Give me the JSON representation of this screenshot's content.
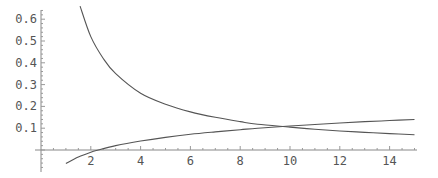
{
  "chart_data": {
    "type": "line",
    "title": "",
    "xlabel": "",
    "ylabel": "",
    "xlim": [
      0,
      15.1
    ],
    "ylim": [
      -0.09,
      0.66
    ],
    "grid": false,
    "legend": null,
    "x_ticks": [
      2,
      4,
      6,
      8,
      10,
      12,
      14
    ],
    "x_tick_labels": [
      "2",
      "4",
      "6",
      "8",
      "10",
      "12",
      "14"
    ],
    "y_ticks": [
      0.1,
      0.2,
      0.3,
      0.4,
      0.5,
      0.6
    ],
    "y_tick_labels": [
      "0.1",
      "0.2",
      "0.3",
      "0.4",
      "0.5",
      "0.6"
    ],
    "series": [
      {
        "name": "decreasing",
        "x": [
          1.57,
          2,
          2.5,
          3,
          4,
          5,
          6,
          7,
          8,
          8.7,
          10,
          11,
          12,
          13,
          14,
          15
        ],
        "values": [
          0.66,
          0.52,
          0.42,
          0.35,
          0.26,
          0.21,
          0.175,
          0.15,
          0.13,
          0.118,
          0.105,
          0.095,
          0.087,
          0.081,
          0.075,
          0.07
        ]
      },
      {
        "name": "increasing",
        "x": [
          1,
          1.5,
          2,
          2.3,
          3,
          4,
          5,
          6,
          7,
          8,
          8.7,
          10,
          11,
          12,
          13,
          14,
          15
        ],
        "values": [
          -0.062,
          -0.032,
          -0.01,
          0.0,
          0.02,
          0.041,
          0.058,
          0.072,
          0.083,
          0.093,
          0.1,
          0.11,
          0.117,
          0.124,
          0.13,
          0.135,
          0.14
        ]
      }
    ],
    "annotations": []
  },
  "layout": {
    "origin_px": [
      41,
      150
    ],
    "x_px_per_unit": 24.9,
    "y_px_per_unit": 218,
    "x_axis_range_px": [
      35,
      417
    ],
    "y_axis_range_px": [
      10,
      172
    ],
    "colors": {
      "axis": "#888888",
      "curve": "#555555",
      "label": "#555555"
    }
  }
}
